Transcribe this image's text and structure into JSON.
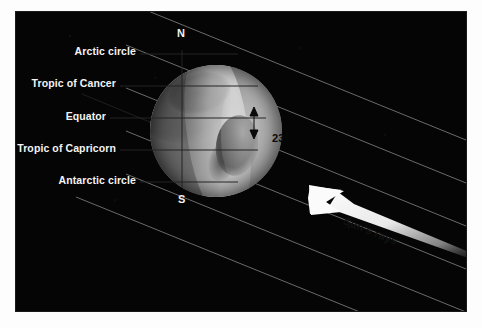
{
  "figure": {
    "background_color": "#ffffff",
    "sky_color": "#050505"
  },
  "globe": {
    "name": "earth-globe",
    "poles": {
      "north_label": "N",
      "south_label": "S"
    }
  },
  "latitude_labels": [
    {
      "id": "arctic-circle",
      "label": "Arctic circle"
    },
    {
      "id": "tropic-of-cancer",
      "label": "Tropic of Cancer"
    },
    {
      "id": "equator",
      "label": "Equator"
    },
    {
      "id": "tropic-of-capricorn",
      "label": "Tropic of Capricorn"
    },
    {
      "id": "antarctic-circle",
      "label": "Antarctic circle"
    }
  ],
  "annotations": {
    "tilt_angle": "23°",
    "sun_rays_label": "Sun's rays"
  },
  "colors": {
    "label_text": "#f4f4f4",
    "ray_line": "#7d7d7d",
    "arrow_fill": "#f0f0f0",
    "annotation_text": "#0a0a0a",
    "latitude_line": "#2a2a2a"
  }
}
